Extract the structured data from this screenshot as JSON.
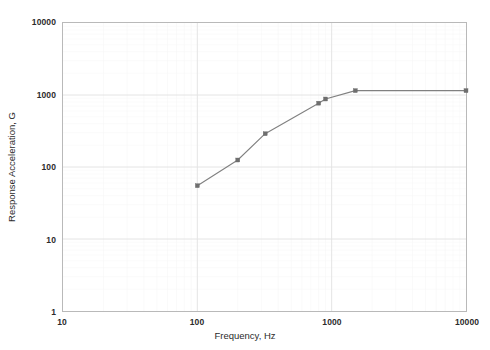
{
  "chart_data": {
    "type": "line",
    "title": "",
    "xlabel": "Frequency, Hz",
    "ylabel": "Response Acceleration, G",
    "xscale": "log",
    "yscale": "log",
    "xlim": [
      10,
      10000
    ],
    "ylim": [
      1,
      10000
    ],
    "grid": true,
    "legend": false,
    "x_ticks": [
      "10",
      "100",
      "1000",
      "10000"
    ],
    "x_tick_values": [
      10,
      100,
      1000,
      10000
    ],
    "y_ticks": [
      "1",
      "10",
      "100",
      "1000",
      "10000"
    ],
    "y_tick_values": [
      1,
      10,
      100,
      1000,
      10000
    ],
    "series": [
      {
        "name": "Response Acceleration",
        "color": "#808080",
        "marker": "square",
        "x": [
          100,
          200,
          320,
          800,
          900,
          1500,
          10000
        ],
        "y": [
          55,
          125,
          290,
          770,
          880,
          1150,
          1150
        ]
      }
    ]
  },
  "axes": {
    "x_title": "Frequency, Hz",
    "y_title": "Response Acceleration, G"
  },
  "style": {
    "line_color": "#808080",
    "marker_color": "#6e6e6e",
    "grid_color": "#e4e4e4",
    "frame_color": "#b9b9b9",
    "text_color": "#2b2b2b",
    "background": "#ffffff"
  }
}
